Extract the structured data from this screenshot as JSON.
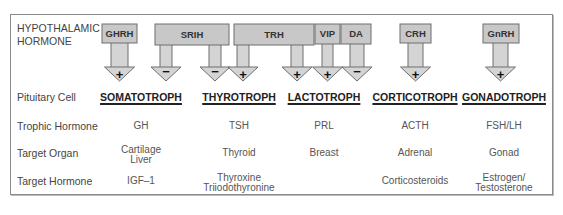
{
  "row_labels": {
    "hypothalamic_line1": "HYPOTHALAMIC",
    "hypothalamic_line2": "HORMONE",
    "pituitary_cell": "Pituitary Cell",
    "trophic_hormone": "Trophic Hormone",
    "target_organ": "Target Organ",
    "target_hormone": "Target Hormone"
  },
  "hypothalamic_hormones": [
    {
      "name": "GHRH",
      "effects": [
        {
          "target": "SOMATOTROPH",
          "sign": "+"
        }
      ]
    },
    {
      "name": "SRIH",
      "effects": [
        {
          "target": "SOMATOTROPH",
          "sign": "−"
        },
        {
          "target": "THYROTROPH",
          "sign": "−"
        }
      ]
    },
    {
      "name": "TRH",
      "effects": [
        {
          "target": "THYROTROPH",
          "sign": "+"
        },
        {
          "target": "LACTOTROPH",
          "sign": "+"
        }
      ]
    },
    {
      "name": "VIP",
      "effects": [
        {
          "target": "LACTOTROPH",
          "sign": "+"
        }
      ]
    },
    {
      "name": "DA",
      "effects": [
        {
          "target": "LACTOTROPH",
          "sign": "−"
        }
      ]
    },
    {
      "name": "CRH",
      "effects": [
        {
          "target": "CORTICOTROPH",
          "sign": "+"
        }
      ]
    },
    {
      "name": "GnRH",
      "effects": [
        {
          "target": "GONADOTROPH",
          "sign": "+"
        }
      ]
    }
  ],
  "columns": [
    {
      "cell": "SOMATOTROPH",
      "trophic": "GH",
      "organ_l1": "Cartilage",
      "organ_l2": "Liver",
      "hormone_l1": "IGF–1",
      "hormone_l2": ""
    },
    {
      "cell": "THYROTROPH",
      "trophic": "TSH",
      "organ_l1": "Thyroid",
      "organ_l2": "",
      "hormone_l1": "Thyroxine",
      "hormone_l2": "Triiodothyronine"
    },
    {
      "cell": "LACTOTROPH",
      "trophic": "PRL",
      "organ_l1": "Breast",
      "organ_l2": "",
      "hormone_l1": "",
      "hormone_l2": ""
    },
    {
      "cell": "CORTICOTROPH",
      "trophic": "ACTH",
      "organ_l1": "Adrenal",
      "organ_l2": "",
      "hormone_l1": "Corticosteroids",
      "hormone_l2": ""
    },
    {
      "cell": "GONADOTROPH",
      "trophic": "FSH/LH",
      "organ_l1": "Gonad",
      "organ_l2": "",
      "hormone_l1": "Estrogen/",
      "hormone_l2": "Testosterone"
    }
  ],
  "colors": {
    "box_fill": "#c8c8c8",
    "box_stroke": "#6e6e6e",
    "arrow_fill": "#d4d4d4",
    "frame": "#8a8a8a"
  }
}
